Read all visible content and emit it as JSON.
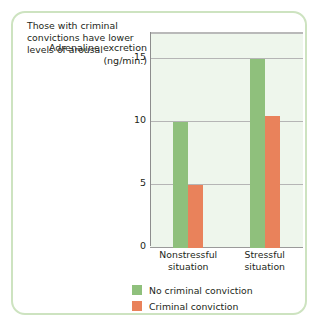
{
  "chart_data": {
    "type": "bar",
    "title": "",
    "annotation": "Those with criminal convictions have lower levels of arousal",
    "xlabel": "",
    "ylabel": "Adrenaline excretion (ng/min.)",
    "categories": [
      "Nonstressful situation",
      "Stressful situation"
    ],
    "category_lines": [
      [
        "Nonstressful",
        "situation"
      ],
      [
        "Stressful",
        "situation"
      ]
    ],
    "series": [
      {
        "name": "No criminal conviction",
        "color": "#8fc07c",
        "values": [
          10,
          15
        ]
      },
      {
        "name": "Criminal conviction",
        "color": "#e9825b",
        "values": [
          5,
          10.5
        ]
      }
    ],
    "ylim": [
      0,
      17
    ],
    "yticks": [
      0,
      5,
      10,
      15
    ],
    "ytick_labels": [
      "0",
      "5",
      "10",
      "15"
    ],
    "grid": true,
    "legend_position": "bottom"
  },
  "figure": {
    "border_color": "#cde3c0",
    "plot_background": "#eef6ec",
    "axis_color": "#8d8d8d",
    "text_color": "#231f20"
  }
}
